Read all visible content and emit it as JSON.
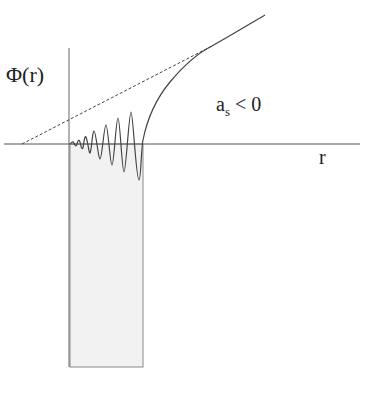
{
  "diagram": {
    "y_axis_label": "Φ(r)",
    "x_axis_label": "r",
    "condition_label_main": "a",
    "condition_label_sub": "s",
    "condition_label_rest": " < 0",
    "elements": {
      "potential_well": "shaded rectangular well region",
      "wavefunction": "oscillating radial wavefunction growing in amplitude inside the well, then rising monotonically outside",
      "asymptote": "dashed straight-line extrapolation crossing the r-axis at negative r"
    },
    "colors": {
      "line": "#555555",
      "well_fill": "#f2f2f2",
      "well_border": "#8a8a8a",
      "text": "#222222"
    }
  }
}
